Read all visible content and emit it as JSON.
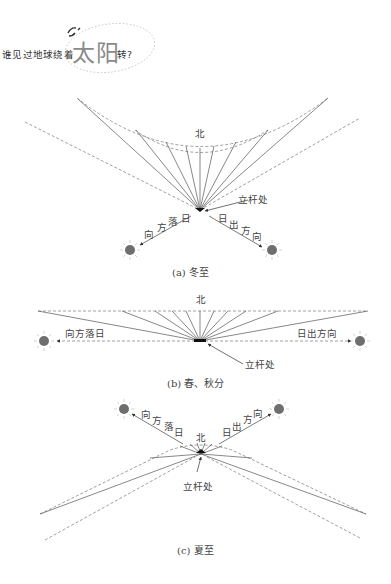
{
  "header": {
    "question_prefix": "谁见过地球绕着",
    "question_highlight": "太阳",
    "question_suffix": "转?"
  },
  "diagrams": [
    {
      "id": "a",
      "caption": "(a) 冬至",
      "north_label": "北",
      "pole_label": "立杆处",
      "sunset_label": [
        "向",
        "方",
        "落",
        "日"
      ],
      "sunrise_label": [
        "日",
        "出",
        "方",
        "向"
      ]
    },
    {
      "id": "b",
      "caption": "(b) 春、秋分",
      "north_label": "北",
      "pole_label": "立杆处",
      "sunset_label": "向方落日",
      "sunrise_label": "日出方向"
    },
    {
      "id": "c",
      "caption": "(c) 夏至",
      "north_label": "北",
      "pole_label": "立杆处",
      "sunset_label": [
        "向",
        "方",
        "落",
        "日"
      ],
      "sunrise_label": [
        "日",
        "出",
        "方",
        "向"
      ]
    }
  ],
  "colors": {
    "line": "#555555",
    "dashed": "#777777",
    "sun": "#6e6e6e",
    "sun_ray": "#c8c8c8"
  }
}
